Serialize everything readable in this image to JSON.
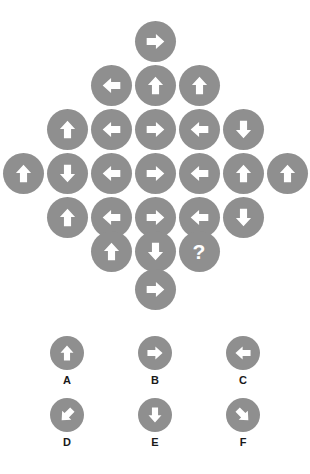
{
  "puzzle": {
    "title": "Arrow Diamond Matrix Puzzle",
    "missing_marker": "?",
    "colors": {
      "circle_fill": "#8f8f8f",
      "arrow_fill": "#ffffff",
      "background": "#ffffff",
      "label_text": "#1a1a1a"
    },
    "matrix": {
      "shape": "diamond",
      "row_counts": [
        1,
        3,
        5,
        7,
        5,
        3,
        1
      ],
      "rows": [
        {
          "index": 1,
          "cells": [
            {
              "icon": "arrow-right-icon",
              "direction": "right"
            }
          ]
        },
        {
          "index": 2,
          "cells": [
            {
              "icon": "arrow-left-icon",
              "direction": "left"
            },
            {
              "icon": "arrow-up-icon",
              "direction": "up"
            },
            {
              "icon": "arrow-up-icon",
              "direction": "up"
            }
          ]
        },
        {
          "index": 3,
          "cells": [
            {
              "icon": "arrow-up-icon",
              "direction": "up"
            },
            {
              "icon": "arrow-left-icon",
              "direction": "left"
            },
            {
              "icon": "arrow-right-icon",
              "direction": "right"
            },
            {
              "icon": "arrow-left-icon",
              "direction": "left"
            },
            {
              "icon": "arrow-down-icon",
              "direction": "down"
            }
          ]
        },
        {
          "index": 4,
          "cells": [
            {
              "icon": "arrow-up-icon",
              "direction": "up"
            },
            {
              "icon": "arrow-down-icon",
              "direction": "down"
            },
            {
              "icon": "arrow-left-icon",
              "direction": "left"
            },
            {
              "icon": "arrow-right-icon",
              "direction": "right"
            },
            {
              "icon": "arrow-left-icon",
              "direction": "left"
            },
            {
              "icon": "arrow-up-icon",
              "direction": "up"
            },
            {
              "icon": "arrow-up-icon",
              "direction": "up"
            }
          ]
        },
        {
          "index": 5,
          "cells": [
            {
              "icon": "arrow-up-icon",
              "direction": "up"
            },
            {
              "icon": "arrow-left-icon",
              "direction": "left"
            },
            {
              "icon": "arrow-right-icon",
              "direction": "right"
            },
            {
              "icon": "arrow-left-icon",
              "direction": "left"
            },
            {
              "icon": "arrow-down-icon",
              "direction": "down"
            }
          ]
        },
        {
          "index": 6,
          "cells": [
            {
              "icon": "arrow-up-icon",
              "direction": "up"
            },
            {
              "icon": "arrow-down-icon",
              "direction": "down"
            },
            {
              "icon": "question-mark-icon",
              "direction": "missing",
              "label": "?"
            }
          ]
        },
        {
          "index": 7,
          "cells": [
            {
              "icon": "arrow-right-icon",
              "direction": "right"
            }
          ]
        }
      ]
    },
    "options": {
      "rows": [
        [
          {
            "label": "A",
            "icon": "arrow-up-icon",
            "direction": "up"
          },
          {
            "label": "B",
            "icon": "arrow-right-icon",
            "direction": "right"
          },
          {
            "label": "C",
            "icon": "arrow-left-icon",
            "direction": "left"
          }
        ],
        [
          {
            "label": "D",
            "icon": "arrow-down-left-icon",
            "direction": "down-left"
          },
          {
            "label": "E",
            "icon": "arrow-down-icon",
            "direction": "down"
          },
          {
            "label": "F",
            "icon": "arrow-down-right-icon",
            "direction": "down-right"
          }
        ]
      ]
    }
  }
}
